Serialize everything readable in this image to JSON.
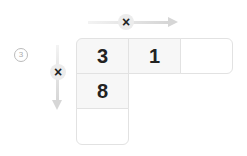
{
  "label": {
    "number": "3"
  },
  "horizontal_factor": {
    "mark": "×"
  },
  "vertical_factor": {
    "mark": "×"
  },
  "row_cells": [
    "3",
    "1",
    ""
  ],
  "column_cells": [
    "8",
    ""
  ]
}
